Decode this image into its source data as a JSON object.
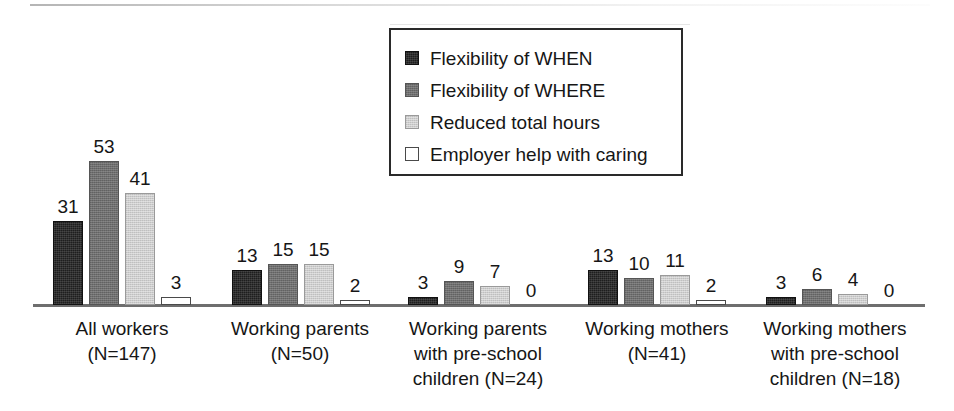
{
  "chart_data": {
    "type": "bar",
    "title": "",
    "subtitle": "",
    "xlabel": "",
    "ylabel": "",
    "ylim": [
      0,
      56
    ],
    "grid": false,
    "legend_position": "top-center",
    "value_labels": true,
    "categories": [
      "All workers\n(N=147)",
      "Working parents\n(N=50)",
      "Working parents\nwith pre-school\nchildren (N=24)",
      "Working mothers\n(N=41)",
      "Working mothers\nwith pre-school\nchildren (N=18)"
    ],
    "series": [
      {
        "name": "Flexibility of WHEN",
        "color": "#1e1e1e",
        "values": [
          31,
          13,
          3,
          13,
          3
        ]
      },
      {
        "name": "Flexibility of WHERE",
        "color": "#6f6f6f",
        "values": [
          53,
          15,
          9,
          10,
          6
        ]
      },
      {
        "name": "Reduced total hours",
        "color": "#cdcdcd",
        "values": [
          41,
          15,
          7,
          11,
          4
        ]
      },
      {
        "name": "Employer help with caring",
        "color": "#ffffff",
        "values": [
          3,
          2,
          0,
          2,
          0
        ]
      }
    ]
  },
  "legend": {
    "items": [
      {
        "label": "Flexibility of WHEN",
        "swatch": "swatch-black"
      },
      {
        "label": "Flexibility of WHERE",
        "swatch": "swatch-dark-gray"
      },
      {
        "label": "Reduced total hours",
        "swatch": "swatch-light-gray"
      },
      {
        "label": "Employer help with caring",
        "swatch": "swatch-white"
      }
    ]
  },
  "colors": {
    "series_when": "#1e1e1e",
    "series_where": "#6f6f6f",
    "series_hours": "#cdcdcd",
    "series_caring": "#ffffff",
    "axis": "#6e6e6e",
    "text": "#161616",
    "legend_border": "#2a2a2a"
  }
}
